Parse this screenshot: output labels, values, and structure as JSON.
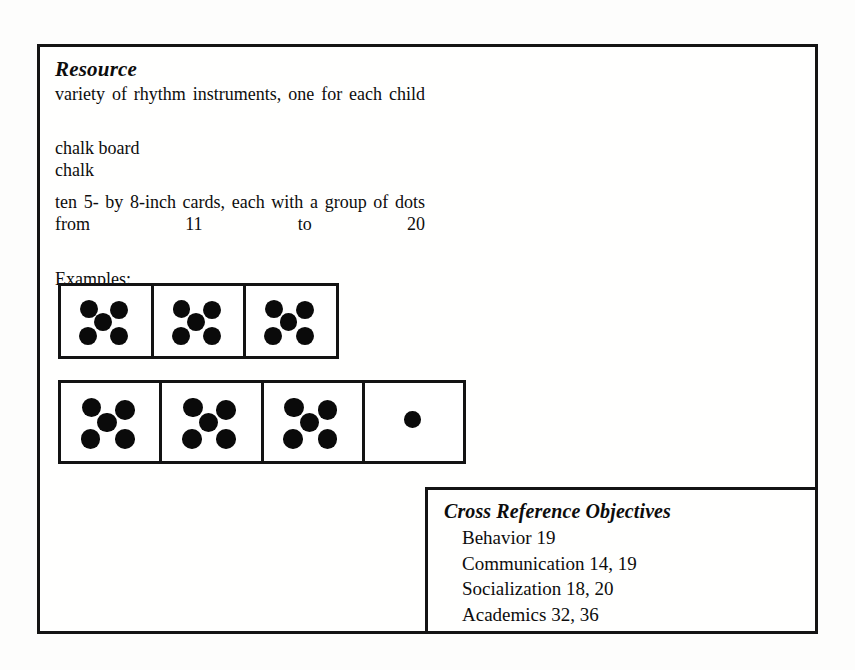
{
  "document": {
    "resource": {
      "heading": "Resource",
      "lines": [
        "variety of rhythm instruments, one for each child",
        "chalk board",
        "chalk",
        "ten 5- by 8-inch cards, each with a group of dots from 11 to 20"
      ],
      "examples_label": "Examples:"
    },
    "example_cards": {
      "row1": [
        {
          "dots": 5,
          "pattern": "quincunx"
        },
        {
          "dots": 5,
          "pattern": "quincunx"
        },
        {
          "dots": 5,
          "pattern": "quincunx"
        }
      ],
      "row2": [
        {
          "dots": 5,
          "pattern": "quincunx"
        },
        {
          "dots": 5,
          "pattern": "quincunx"
        },
        {
          "dots": 5,
          "pattern": "quincunx"
        },
        {
          "dots": 1,
          "pattern": "single"
        }
      ]
    },
    "cross_reference": {
      "heading": "Cross Reference Objectives",
      "entries": [
        "Behavior 19",
        "Communication 14, 19",
        "Socialization 18, 20",
        "Academics 32, 36"
      ]
    }
  },
  "colors": {
    "ink": "#0d0d0d",
    "rule": "#141414",
    "paper": "#fdfdfc"
  }
}
